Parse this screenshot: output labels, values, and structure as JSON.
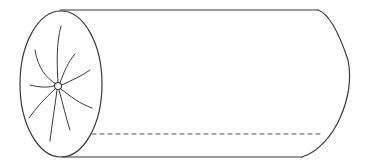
{
  "figure": {
    "width": 371,
    "height": 167,
    "background": "#ffffff",
    "stroke_color": "#3a3a3a",
    "light_stroke_color": "#555555"
  },
  "shapes": {
    "end_face": {
      "center_x": 61,
      "center_y": 84,
      "radius_x": 41,
      "radius_y": 73
    },
    "hub": {
      "cx": 58,
      "cy": 86,
      "r": 3.5
    },
    "spokes": [
      {
        "d": "M58,82 C57,66 56,44 61,26"
      },
      {
        "d": "M56,84 C46,78 38,68 35,50"
      },
      {
        "d": "M60,83 C64,72 68,62 75,54"
      },
      {
        "d": "M62,85 C72,80 82,76 90,70"
      },
      {
        "d": "M54,86 C46,88 38,87 30,85"
      },
      {
        "d": "M61,89 C70,96 80,104 92,108"
      },
      {
        "d": "M55,89 C46,97 36,108 29,118"
      },
      {
        "d": "M57,90 C55,106 52,124 50,141"
      },
      {
        "d": "M59,90 C63,104 66,118 70,130"
      }
    ],
    "top_edge": {
      "x1": 60,
      "y1": 10,
      "x2": 318,
      "y2": 10
    },
    "bottom_edge": {
      "x1": 62,
      "y1": 157,
      "x2": 302,
      "y2": 157
    },
    "far_end_curve": {
      "d": "M318,10 C330,14 340,36 348,60 C352,80 348,100 340,118 C332,136 318,152 302,157"
    },
    "hidden_line": {
      "x1": 92,
      "y1": 134,
      "x2": 324,
      "y2": 134,
      "dash": "4 4"
    }
  }
}
